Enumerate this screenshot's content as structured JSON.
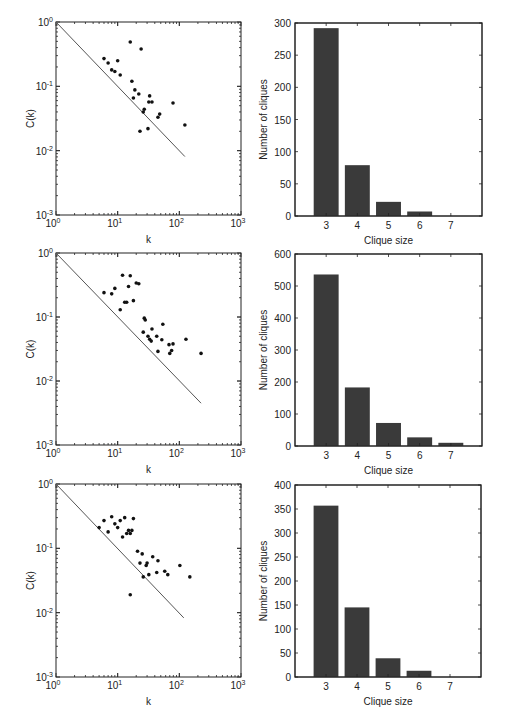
{
  "figure": {
    "width": 505,
    "height": 718,
    "ink_color": "#222222",
    "bar_color": "#3a3a3a",
    "line_color": "#555555"
  },
  "chart_data": [
    {
      "id": "scatter-1",
      "type": "scatter",
      "scale": "loglog",
      "xlabel": "k",
      "ylabel": "C(k)",
      "xlim": [
        1,
        1000
      ],
      "ylim": [
        0.001,
        1
      ],
      "xticks": [
        {
          "base": "10",
          "exp": "0"
        },
        {
          "base": "10",
          "exp": "1"
        },
        {
          "base": "10",
          "exp": "2"
        },
        {
          "base": "10",
          "exp": "3"
        }
      ],
      "yticks": [
        {
          "base": "10",
          "exp": "-3"
        },
        {
          "base": "10",
          "exp": "-2"
        },
        {
          "base": "10",
          "exp": "-1"
        },
        {
          "base": "10",
          "exp": "0"
        }
      ],
      "grid": false,
      "frame": {
        "x": 56,
        "y": 22,
        "w": 185,
        "h": 193
      },
      "points": [
        [
          6,
          0.27
        ],
        [
          7,
          0.23
        ],
        [
          8,
          0.18
        ],
        [
          9,
          0.17
        ],
        [
          10,
          0.25
        ],
        [
          11,
          0.15
        ],
        [
          16,
          0.49
        ],
        [
          24,
          0.38
        ],
        [
          17,
          0.12
        ],
        [
          19,
          0.088
        ],
        [
          22,
          0.076
        ],
        [
          18,
          0.066
        ],
        [
          33,
          0.071
        ],
        [
          32,
          0.057
        ],
        [
          36,
          0.057
        ],
        [
          79,
          0.055
        ],
        [
          27,
          0.044
        ],
        [
          26,
          0.04
        ],
        [
          48,
          0.037
        ],
        [
          45,
          0.033
        ],
        [
          23,
          0.02
        ],
        [
          31,
          0.022
        ],
        [
          123,
          0.025
        ]
      ],
      "fit_line": {
        "label": "C(k) ~ 1/k",
        "from": [
          1,
          1
        ],
        "to": [
          123,
          0.0081
        ]
      }
    },
    {
      "id": "bar-1",
      "type": "bar",
      "xlabel": "Clique size",
      "ylabel": "Number of cliques",
      "categories": [
        "3",
        "4",
        "5",
        "6",
        "7"
      ],
      "values": [
        292,
        79,
        22,
        7,
        0
      ],
      "xlim": [
        2,
        8
      ],
      "ylim": [
        0,
        300
      ],
      "yticks": [
        "0",
        "50",
        "100",
        "150",
        "200",
        "250",
        "300"
      ],
      "grid": false,
      "frame": {
        "x": 295,
        "y": 23,
        "w": 187,
        "h": 193
      }
    },
    {
      "id": "scatter-2",
      "type": "scatter",
      "scale": "loglog",
      "xlabel": "k",
      "ylabel": "C(k)",
      "xlim": [
        1,
        1000
      ],
      "ylim": [
        0.001,
        1
      ],
      "xticks": [
        {
          "base": "10",
          "exp": "0"
        },
        {
          "base": "10",
          "exp": "1"
        },
        {
          "base": "10",
          "exp": "2"
        },
        {
          "base": "10",
          "exp": "3"
        }
      ],
      "yticks": [
        {
          "base": "10",
          "exp": "-3"
        },
        {
          "base": "10",
          "exp": "-2"
        },
        {
          "base": "10",
          "exp": "-1"
        },
        {
          "base": "10",
          "exp": "0"
        }
      ],
      "grid": false,
      "frame": {
        "x": 56,
        "y": 253,
        "w": 185,
        "h": 192
      },
      "points": [
        [
          6,
          0.24
        ],
        [
          8,
          0.23
        ],
        [
          9,
          0.28
        ],
        [
          11,
          0.13
        ],
        [
          12,
          0.45
        ],
        [
          13,
          0.17
        ],
        [
          14,
          0.17
        ],
        [
          15,
          0.3
        ],
        [
          16,
          0.44
        ],
        [
          18,
          0.18
        ],
        [
          20,
          0.34
        ],
        [
          22,
          0.33
        ],
        [
          27,
          0.096
        ],
        [
          28,
          0.09
        ],
        [
          26,
          0.058
        ],
        [
          31,
          0.05
        ],
        [
          33,
          0.045
        ],
        [
          35,
          0.042
        ],
        [
          36,
          0.065
        ],
        [
          43,
          0.05
        ],
        [
          52,
          0.044
        ],
        [
          54,
          0.077
        ],
        [
          45,
          0.029
        ],
        [
          68,
          0.037
        ],
        [
          79,
          0.038
        ],
        [
          75,
          0.03
        ],
        [
          70,
          0.027
        ],
        [
          128,
          0.045
        ],
        [
          225,
          0.027
        ]
      ],
      "fit_line": {
        "label": "C(k) ~ 1/k",
        "from": [
          1,
          1
        ],
        "to": [
          225,
          0.0045
        ]
      }
    },
    {
      "id": "bar-2",
      "type": "bar",
      "xlabel": "Clique size",
      "ylabel": "Number of cliques",
      "categories": [
        "3",
        "4",
        "5",
        "6",
        "7"
      ],
      "values": [
        536,
        183,
        72,
        27,
        10
      ],
      "xlim": [
        2,
        8
      ],
      "ylim": [
        0,
        600
      ],
      "yticks": [
        "0",
        "100",
        "200",
        "300",
        "400",
        "500",
        "600"
      ],
      "grid": false,
      "frame": {
        "x": 295,
        "y": 254,
        "w": 187,
        "h": 192
      }
    },
    {
      "id": "scatter-3",
      "type": "scatter",
      "scale": "loglog",
      "xlabel": "k",
      "ylabel": "C(k)",
      "xlim": [
        1,
        1000
      ],
      "ylim": [
        0.001,
        1
      ],
      "xticks": [
        {
          "base": "10",
          "exp": "0"
        },
        {
          "base": "10",
          "exp": "1"
        },
        {
          "base": "10",
          "exp": "2"
        },
        {
          "base": "10",
          "exp": "3"
        }
      ],
      "yticks": [
        {
          "base": "10",
          "exp": "-3"
        },
        {
          "base": "10",
          "exp": "-2"
        },
        {
          "base": "10",
          "exp": "-1"
        },
        {
          "base": "10",
          "exp": "0"
        }
      ],
      "grid": false,
      "frame": {
        "x": 56,
        "y": 484,
        "w": 185,
        "h": 193
      },
      "points": [
        [
          5,
          0.21
        ],
        [
          6,
          0.27
        ],
        [
          7,
          0.18
        ],
        [
          8,
          0.31
        ],
        [
          9,
          0.24
        ],
        [
          10,
          0.21
        ],
        [
          11,
          0.27
        ],
        [
          12,
          0.15
        ],
        [
          13,
          0.3
        ],
        [
          14,
          0.17
        ],
        [
          15,
          0.19
        ],
        [
          16,
          0.17
        ],
        [
          17,
          0.19
        ],
        [
          18,
          0.29
        ],
        [
          16,
          0.019
        ],
        [
          21,
          0.09
        ],
        [
          25,
          0.082
        ],
        [
          23,
          0.059
        ],
        [
          29,
          0.054
        ],
        [
          30,
          0.059
        ],
        [
          26,
          0.036
        ],
        [
          32,
          0.039
        ],
        [
          37,
          0.074
        ],
        [
          43,
          0.042
        ],
        [
          45,
          0.064
        ],
        [
          58,
          0.044
        ],
        [
          65,
          0.039
        ],
        [
          102,
          0.054
        ],
        [
          148,
          0.036
        ]
      ],
      "fit_line": {
        "label": "C(k) ~ 1/k",
        "from": [
          1,
          1
        ],
        "to": [
          118,
          0.0083
        ]
      }
    },
    {
      "id": "bar-3",
      "type": "bar",
      "xlabel": "Clique size",
      "ylabel": "Number of cliques",
      "categories": [
        "3",
        "4",
        "5",
        "6",
        "7"
      ],
      "values": [
        357,
        145,
        39,
        13,
        0
      ],
      "xlim": [
        2,
        8
      ],
      "ylim": [
        0,
        400
      ],
      "yticks": [
        "0",
        "50",
        "100",
        "150",
        "200",
        "250",
        "300",
        "350",
        "400"
      ],
      "grid": false,
      "frame": {
        "x": 295,
        "y": 485,
        "w": 186,
        "h": 192
      }
    }
  ]
}
